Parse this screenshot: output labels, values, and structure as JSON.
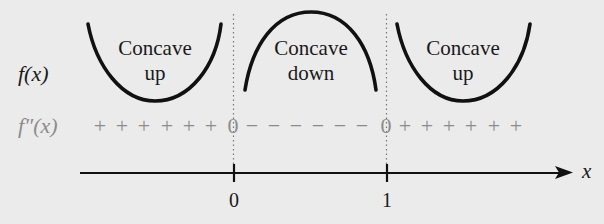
{
  "diagram": {
    "type": "concavity-sign-chart",
    "rows": {
      "function_label": "f(x)",
      "second_derivative_label": "f″(x)"
    },
    "regions": [
      {
        "shape": "cup",
        "label_line1": "Concave",
        "label_line2": "up"
      },
      {
        "shape": "cap",
        "label_line1": "Concave",
        "label_line2": "down"
      },
      {
        "shape": "cup",
        "label_line1": "Concave",
        "label_line2": "up"
      }
    ],
    "sign_chart": {
      "left_signs": [
        "+",
        "+",
        "+",
        "+",
        "+",
        "+"
      ],
      "zero_1": "0",
      "middle_signs": [
        "−",
        "−",
        "−",
        "−",
        "−",
        "−"
      ],
      "zero_2": "0",
      "right_signs": [
        "+",
        "+",
        "+",
        "+",
        "+",
        "+"
      ]
    },
    "axis": {
      "variable": "x",
      "ticks": [
        {
          "value": 0,
          "label": "0"
        },
        {
          "value": 1,
          "label": "1"
        }
      ]
    },
    "colors": {
      "background": "#ebebeb",
      "ink": "#111111",
      "sign_row": "#8c8c8c"
    }
  }
}
